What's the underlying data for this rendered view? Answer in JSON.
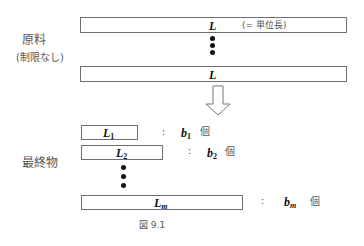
{
  "raw_material": {
    "label": "原料",
    "sublabel": "(制限なし)",
    "bars": [
      {
        "var": "L",
        "note": "(= 単位長)"
      },
      {
        "var": "L",
        "note": ""
      }
    ]
  },
  "arrow": {
    "direction": "down"
  },
  "final_products": {
    "label": "最終物",
    "items": [
      {
        "var": "L",
        "sub": "1",
        "colon": ":",
        "count_var": "b",
        "count_sub": "1",
        "unit": "個"
      },
      {
        "var": "L",
        "sub": "2",
        "colon": ":",
        "count_var": "b",
        "count_sub": "2",
        "unit": "個"
      },
      {
        "var": "L",
        "sub": "m",
        "colon": ":",
        "count_var": "b",
        "count_sub": "m",
        "unit": "個"
      }
    ]
  },
  "caption": "図 9.1"
}
